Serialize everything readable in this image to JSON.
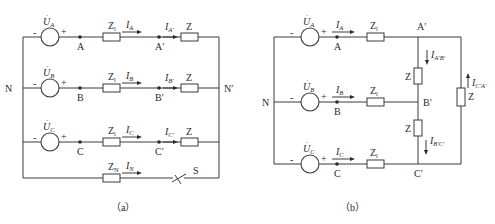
{
  "figure": {
    "a": {
      "caption": "（a）",
      "title": "Y-Y three-phase circuit with neutral line and switch",
      "sources": [
        {
          "label": "U",
          "sub": "A",
          "minus": "-",
          "plus": "+"
        },
        {
          "label": "U",
          "sub": "B",
          "minus": "-",
          "plus": "+"
        },
        {
          "label": "U",
          "sub": "C",
          "minus": "-",
          "plus": "+"
        }
      ],
      "nodes": {
        "A": "A",
        "B": "B",
        "C": "C",
        "A2": "A′",
        "B2": "B′",
        "C2": "C′",
        "N": "N",
        "N2": "N′",
        "S": "S"
      },
      "line_impedance": {
        "label": "Z",
        "sub": "l"
      },
      "load_impedance": {
        "label": "Z"
      },
      "neutral_impedance": {
        "label": "Z",
        "sub": "N"
      },
      "currents": {
        "IA": {
          "label": "I",
          "sub": "A"
        },
        "IB": {
          "label": "I",
          "sub": "B"
        },
        "IC": {
          "label": "I",
          "sub": "C"
        },
        "IA2": {
          "label": "I",
          "sub": "A′"
        },
        "IB2": {
          "label": "I",
          "sub": "B′"
        },
        "IC2": {
          "label": "I",
          "sub": "C′"
        },
        "IN": {
          "label": "I",
          "sub": "N"
        }
      }
    },
    "b": {
      "caption": "（b）",
      "title": "Y-Δ three-phase circuit",
      "sources": [
        {
          "label": "U",
          "sub": "A",
          "minus": "-",
          "plus": "+"
        },
        {
          "label": "U",
          "sub": "B",
          "minus": "-",
          "plus": "+"
        },
        {
          "label": "U",
          "sub": "C",
          "minus": "-",
          "plus": "+"
        }
      ],
      "nodes": {
        "A": "A",
        "B": "B",
        "C": "C",
        "A2": "A′",
        "B2": "B′",
        "C2": "C′",
        "N": "N"
      },
      "line_impedance": {
        "label": "Z",
        "sub": "l"
      },
      "load_impedance": {
        "label": "Z"
      },
      "currents": {
        "IA": {
          "label": "I",
          "sub": "A"
        },
        "IB": {
          "label": "I",
          "sub": "B"
        },
        "IC": {
          "label": "I",
          "sub": "C"
        },
        "IAB": {
          "label": "I",
          "sub": "A′B′"
        },
        "IBC": {
          "label": "I",
          "sub": "B′C′"
        },
        "ICA": {
          "label": "I",
          "sub": "C′A′"
        }
      }
    }
  }
}
